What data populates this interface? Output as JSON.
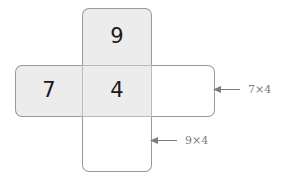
{
  "figure": {
    "type": "area-model-net",
    "cells": {
      "top": {
        "value": "9",
        "shaded": true
      },
      "left": {
        "value": "7",
        "shaded": true
      },
      "center": {
        "value": "4",
        "shaded": true
      },
      "right": {
        "value": "",
        "shaded": false
      },
      "bottom": {
        "value": "",
        "shaded": false
      }
    },
    "annotations": [
      {
        "label": "7×4",
        "arrow": "left",
        "target": "right-rectangle"
      },
      {
        "label": "9×4",
        "arrow": "left",
        "target": "bottom-rectangle"
      }
    ],
    "colors": {
      "shade_fill": "#ececec",
      "plain_fill": "#ffffff",
      "outline": "#9a9a9a",
      "digit": "#1a1a1a",
      "annotation": "#7d7d7d"
    }
  }
}
